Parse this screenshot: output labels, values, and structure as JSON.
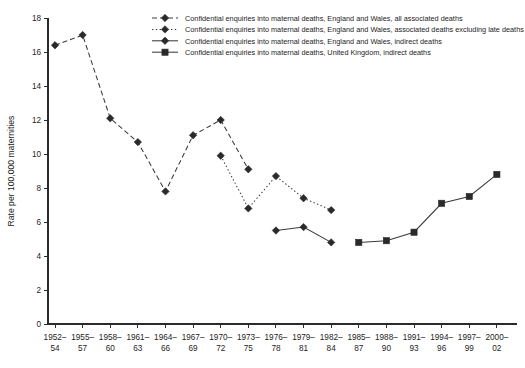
{
  "chart_data": {
    "type": "line",
    "title": "",
    "xlabel": "",
    "ylabel": "Rate per 100,000 maternities",
    "ylim": [
      0,
      18
    ],
    "ytick_step": 2,
    "yticks": [
      "0",
      "2",
      "4",
      "6",
      "8",
      "10",
      "12",
      "14",
      "16",
      "18"
    ],
    "grid": false,
    "legend_position": "top-center",
    "categories": [
      "1952–54",
      "1955–57",
      "1958–60",
      "1961–63",
      "1964–66",
      "1967–69",
      "1970–72",
      "1973–75",
      "1976–78",
      "1979–81",
      "1982–84",
      "1985–87",
      "1988–90",
      "1991–93",
      "1994–96",
      "1997–99",
      "2000–02"
    ],
    "categories_line1": [
      "1952–",
      "1955–",
      "1958–",
      "1961–",
      "1964–",
      "1967–",
      "1970–",
      "1973–",
      "1976–",
      "1979–",
      "1982–",
      "1985–",
      "1988–",
      "1991–",
      "1994–",
      "1997–",
      "2000–"
    ],
    "categories_line2": [
      "54",
      "57",
      "60",
      "63",
      "66",
      "69",
      "72",
      "75",
      "78",
      "81",
      "84",
      "87",
      "90",
      "93",
      "96",
      "99",
      "02"
    ],
    "series": [
      {
        "name": "Confidential enquiries into maternal deaths, England and Wales, all associated deaths",
        "marker": "diamond",
        "dash": "dashed",
        "color": "#3a3a3a",
        "points": [
          {
            "x": "1952–54",
            "y": 16.4
          },
          {
            "x": "1955–57",
            "y": 17.0
          },
          {
            "x": "1958–60",
            "y": 12.1
          },
          {
            "x": "1961–63",
            "y": 10.7
          },
          {
            "x": "1964–66",
            "y": 7.8
          },
          {
            "x": "1967–69",
            "y": 11.1
          },
          {
            "x": "1970–72",
            "y": 12.0
          },
          {
            "x": "1973–75",
            "y": 9.1
          }
        ]
      },
      {
        "name": "Confidential enquiries into maternal deaths, England and Wales, associated deaths excluding late deaths",
        "marker": "diamond",
        "dash": "dotted",
        "color": "#3a3a3a",
        "points": [
          {
            "x": "1970–72",
            "y": 9.9
          },
          {
            "x": "1973–75",
            "y": 6.8
          },
          {
            "x": "1976–78",
            "y": 8.7
          },
          {
            "x": "1979–81",
            "y": 7.4
          },
          {
            "x": "1982–84",
            "y": 6.7
          }
        ]
      },
      {
        "name": "Confidential enquiries into maternal deaths, England and Wales, indirect deaths",
        "marker": "diamond",
        "dash": "solid",
        "color": "#3a3a3a",
        "points": [
          {
            "x": "1976–78",
            "y": 5.5
          },
          {
            "x": "1979–81",
            "y": 5.7
          },
          {
            "x": "1982–84",
            "y": 4.8
          }
        ]
      },
      {
        "name": "Confidential enquiries into maternal deaths, United Kingdom, indirect deaths",
        "marker": "square",
        "dash": "solid",
        "color": "#3a3a3a",
        "points": [
          {
            "x": "1985–87",
            "y": 4.8
          },
          {
            "x": "1988–90",
            "y": 4.9
          },
          {
            "x": "1991–93",
            "y": 5.4
          },
          {
            "x": "1994–96",
            "y": 7.1
          },
          {
            "x": "1997–99",
            "y": 7.5
          },
          {
            "x": "2000–02",
            "y": 8.8
          }
        ]
      }
    ]
  }
}
